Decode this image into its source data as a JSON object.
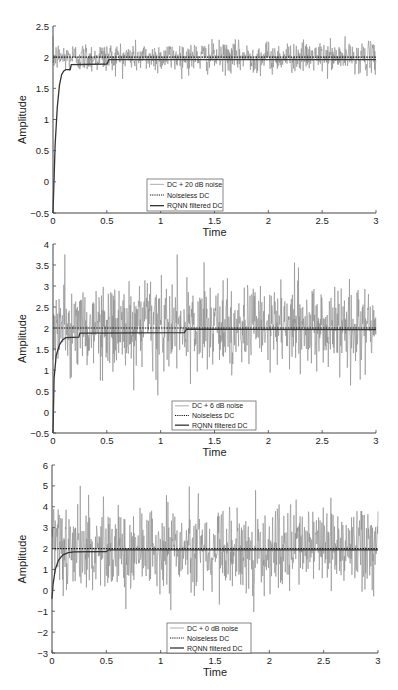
{
  "figure": {
    "width": 398,
    "height": 690,
    "colors": {
      "noisy": "#8a8a8a",
      "noiseless": "#111111",
      "filtered": "#333333",
      "axis": "#444444"
    }
  },
  "chart_data": [
    {
      "type": "line",
      "title": "",
      "xlabel": "Time",
      "ylabel": "Amplitude",
      "xlim": [
        0,
        3
      ],
      "ylim": [
        -0.5,
        2.5
      ],
      "xticks": [
        0,
        0.5,
        1,
        1.5,
        2,
        2.5,
        3
      ],
      "xtick_labels": [
        "0",
        "0.5",
        "1",
        "1.5",
        "2",
        "2.5",
        "3"
      ],
      "yticks": [
        -0.5,
        0,
        0.5,
        1,
        1.5,
        2,
        2.5
      ],
      "ytick_labels": [
        "-0.5",
        "0",
        "0.5",
        "1",
        "1.5",
        "2",
        "2.5"
      ],
      "grid": false,
      "legend_position": "lower center",
      "legend": [
        "DC + 20 dB noise",
        "Noiseless DC",
        "RQNN filtered DC"
      ],
      "series": [
        {
          "name": "DC + 20 dB noise",
          "style": "solid thin gray",
          "dc": 2.0,
          "noise_std": 0.12,
          "noise_range": [
            1.65,
            2.35
          ]
        },
        {
          "name": "Noiseless DC",
          "style": "dotted",
          "value": 2.0
        },
        {
          "name": "RQNN filtered DC",
          "style": "solid dark",
          "points": [
            [
              0,
              -0.5
            ],
            [
              0.02,
              0.6
            ],
            [
              0.04,
              1.2
            ],
            [
              0.06,
              1.55
            ],
            [
              0.08,
              1.72
            ],
            [
              0.1,
              1.78
            ],
            [
              0.12,
              1.8
            ],
            [
              0.16,
              1.8
            ],
            [
              0.17,
              1.88
            ],
            [
              0.5,
              1.89
            ],
            [
              0.52,
              1.96
            ],
            [
              3,
              1.96
            ]
          ]
        }
      ],
      "plot_box": {
        "x0": 53,
        "x1": 376,
        "y_top": 26,
        "y_bottom": 213
      },
      "legend_box": {
        "x": 147,
        "y": 179,
        "w": 76,
        "h": 32
      }
    },
    {
      "type": "line",
      "title": "",
      "xlabel": "Time",
      "ylabel": "Amplitude",
      "xlim": [
        0,
        3
      ],
      "ylim": [
        -0.5,
        4
      ],
      "xticks": [
        0,
        0.5,
        1,
        1.5,
        2,
        2.5,
        3
      ],
      "xtick_labels": [
        "0",
        "0.5",
        "1",
        "1.5",
        "2",
        "2.5",
        "3"
      ],
      "yticks": [
        -0.5,
        0,
        0.5,
        1,
        1.5,
        2,
        2.5,
        3,
        3.5,
        4
      ],
      "ytick_labels": [
        "-0.5",
        "0",
        "0.5",
        "1",
        "1.5",
        "2",
        "2.5",
        "3",
        "3.5",
        "4"
      ],
      "grid": false,
      "legend_position": "lower center",
      "legend": [
        "DC + 6 dB noise",
        "Noiseless DC",
        "RQNN filtered DC"
      ],
      "series": [
        {
          "name": "DC + 6 dB noise",
          "style": "solid thin gray",
          "dc": 2.0,
          "noise_std": 0.5,
          "noise_range": [
            0.35,
            3.75
          ]
        },
        {
          "name": "Noiseless DC",
          "style": "dotted",
          "value": 2.0
        },
        {
          "name": "RQNN filtered DC",
          "style": "solid dark",
          "points": [
            [
              0,
              -0.5
            ],
            [
              0.01,
              0.8
            ],
            [
              0.03,
              1.35
            ],
            [
              0.06,
              1.6
            ],
            [
              0.09,
              1.72
            ],
            [
              0.12,
              1.77
            ],
            [
              0.24,
              1.78
            ],
            [
              0.25,
              1.88
            ],
            [
              1.22,
              1.89
            ],
            [
              1.24,
              1.97
            ],
            [
              3,
              1.96
            ]
          ]
        }
      ],
      "plot_box": {
        "x0": 53,
        "x1": 376,
        "y_top": 244,
        "y_bottom": 433
      },
      "legend_box": {
        "x": 172,
        "y": 401,
        "w": 84,
        "h": 29
      }
    },
    {
      "type": "line",
      "title": "",
      "xlabel": "Time",
      "ylabel": "Amplitude",
      "xlim": [
        0,
        3
      ],
      "ylim": [
        -3,
        6
      ],
      "xticks": [
        0,
        0.5,
        1,
        1.5,
        2,
        2.5,
        3
      ],
      "xtick_labels": [
        "0",
        "0.5",
        "1",
        "1.5",
        "2",
        "2.5",
        "3"
      ],
      "yticks": [
        -3,
        -2,
        -1,
        0,
        1,
        2,
        3,
        4,
        5,
        6
      ],
      "ytick_labels": [
        "-3",
        "-2",
        "-1",
        "0",
        "1",
        "2",
        "3",
        "4",
        "5",
        "6"
      ],
      "grid": false,
      "legend_position": "lower center",
      "legend": [
        "DC + 0 dB noise",
        "Noiseless DC",
        "RQNN filtered DC"
      ],
      "series": [
        {
          "name": "DC + 0 dB noise",
          "style": "solid thin gray",
          "dc": 2.0,
          "noise_std": 1.0,
          "noise_range": [
            -2.0,
            5.2
          ]
        },
        {
          "name": "Noiseless DC",
          "style": "dotted",
          "value": 2.0
        },
        {
          "name": "RQNN filtered DC",
          "style": "solid dark",
          "points": [
            [
              0,
              -0.4
            ],
            [
              0.01,
              0.3
            ],
            [
              0.03,
              1.0
            ],
            [
              0.06,
              1.45
            ],
            [
              0.1,
              1.7
            ],
            [
              0.15,
              1.8
            ],
            [
              0.2,
              1.84
            ],
            [
              0.5,
              1.86
            ],
            [
              0.52,
              1.94
            ],
            [
              3,
              1.94
            ]
          ]
        }
      ],
      "plot_box": {
        "x0": 52,
        "x1": 378,
        "y_top": 465,
        "y_bottom": 653
      },
      "legend_box": {
        "x": 167,
        "y": 623,
        "w": 84,
        "h": 30
      }
    }
  ]
}
